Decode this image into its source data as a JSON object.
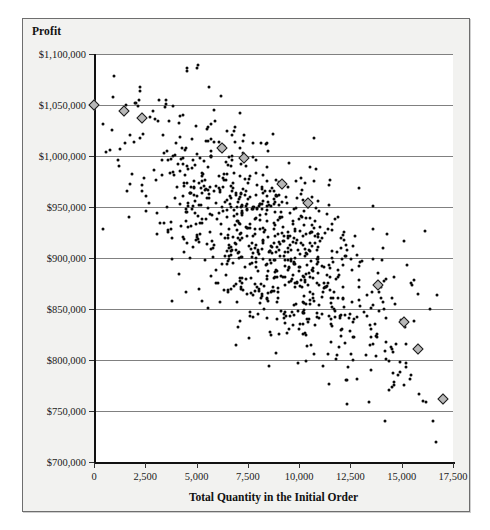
{
  "chart_data": {
    "type": "scatter",
    "title": "",
    "ylabel": "Profit",
    "xlabel": "Total Quantity in the Initial Order",
    "xlim": [
      0,
      17500
    ],
    "ylim": [
      700000,
      1100000
    ],
    "grid": true,
    "legend": null,
    "y_ticks": [
      {
        "value": 1100000,
        "label": "$1,100,000"
      },
      {
        "value": 1050000,
        "label": "$1,050,000"
      },
      {
        "value": 1000000,
        "label": "$1,000,000"
      },
      {
        "value": 950000,
        "label": "$950,000"
      },
      {
        "value": 900000,
        "label": "$900,000"
      },
      {
        "value": 850000,
        "label": "$850,000"
      },
      {
        "value": 800000,
        "label": "$800,000"
      },
      {
        "value": 750000,
        "label": "$750,000"
      },
      {
        "value": 700000,
        "label": "$700,000"
      }
    ],
    "x_ticks": [
      {
        "value": 0,
        "label": "0"
      },
      {
        "value": 2500,
        "label": "2,500"
      },
      {
        "value": 5000,
        "label": "5,000"
      },
      {
        "value": 7500,
        "label": "7,500"
      },
      {
        "value": 10000,
        "label": "10,000"
      },
      {
        "value": 12500,
        "label": "12,500"
      },
      {
        "value": 15000,
        "label": "15,000"
      },
      {
        "value": 17500,
        "label": "17,500"
      }
    ],
    "series": [
      {
        "name": "frontier-points",
        "marker": "diamond",
        "color": "#b8b8b8",
        "edge_color": "#1a1a1a",
        "points": [
          [
            0,
            1050000
          ],
          [
            1450,
            1044000
          ],
          [
            2350,
            1037000
          ],
          [
            6250,
            1008000
          ],
          [
            7300,
            998000
          ],
          [
            9150,
            973000
          ],
          [
            10450,
            954000
          ],
          [
            13850,
            874000
          ],
          [
            15100,
            837000
          ],
          [
            15800,
            811000
          ],
          [
            17000,
            762000
          ]
        ]
      },
      {
        "name": "simulation-points",
        "marker": "dot",
        "color": "#0a0a0a",
        "note": "dense elliptical cloud of simulated outcomes trending downward",
        "cloud": {
          "count": 900,
          "x_center": 8600,
          "y_center": 915000,
          "x_spread": 3500,
          "y_spread": 46000,
          "slope_per_unit": -14.5,
          "x_min": 400,
          "x_max": 17000,
          "seed": 20240731
        }
      }
    ]
  }
}
